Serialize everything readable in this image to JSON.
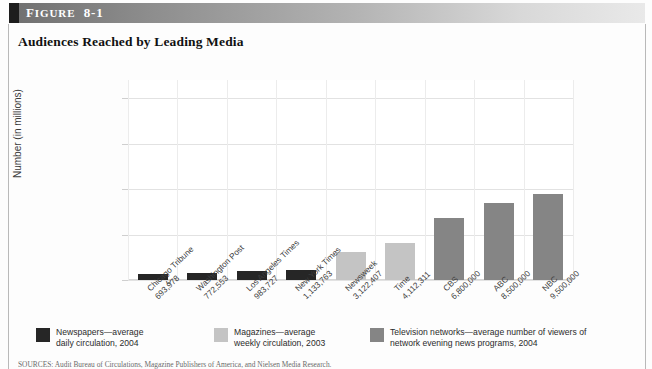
{
  "figure": {
    "label_prefix": "F",
    "label_rest": "IGURE",
    "number": "8-1",
    "title": "Audiences Reached by Leading Media"
  },
  "source_note": "SOURCES: Audit Bureau of Circulations, Magazine Publishers of America, and Nielsen Media Research.",
  "legend": [
    {
      "name": "newspapers",
      "color": "#262626",
      "text": "Newspapers—average\ndaily circulation, 2004"
    },
    {
      "name": "magazines",
      "color": "#c4c4c4",
      "text": "Magazines—average\nweekly circulation, 2003"
    },
    {
      "name": "television",
      "color": "#858585",
      "text": "Television networks—average number of viewers of\nnetwork evening news programs, 2004"
    }
  ],
  "chart_data": {
    "type": "bar",
    "title": "Audiences Reached by Leading Media",
    "xlabel": "",
    "ylabel": "Number (in millions)",
    "ylim": [
      0,
      22
    ],
    "yticks": [
      0,
      5,
      10,
      15,
      20
    ],
    "ytick_labels": [
      "0",
      "5",
      "10",
      "15",
      "20"
    ],
    "grid": true,
    "legend_position": "bottom",
    "categories": [
      "Chicago Tribune",
      "Washington Post",
      "Los Angeles Times",
      "New York Times",
      "Newsweek",
      "Time",
      "CBS",
      "ABC",
      "NBC"
    ],
    "value_labels": [
      "693,978",
      "772,553",
      "983,727",
      "1,133,763",
      "3,122,407",
      "4,112,311",
      "6,800,000",
      "8,500,000",
      "9,500,000"
    ],
    "values": [
      0.694,
      0.773,
      0.984,
      1.134,
      3.122,
      4.112,
      6.8,
      8.5,
      9.5
    ],
    "groups": [
      "newspapers",
      "newspapers",
      "newspapers",
      "newspapers",
      "magazines",
      "magazines",
      "television",
      "television",
      "television"
    ],
    "colors": {
      "newspapers": "#262626",
      "magazines": "#c4c4c4",
      "television": "#858585"
    }
  }
}
